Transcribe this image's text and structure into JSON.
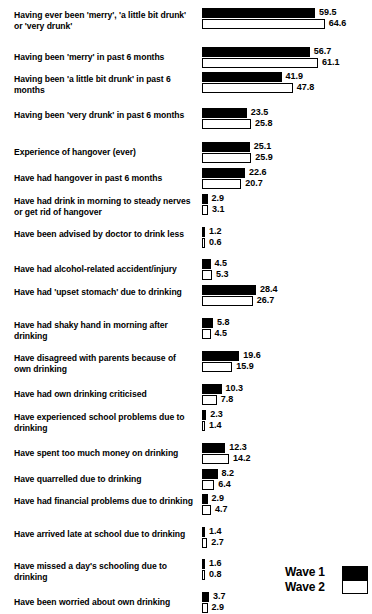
{
  "chart_data": {
    "type": "bar",
    "title": "",
    "subtitle": "",
    "xlabel": "",
    "ylabel": "",
    "orientation": "horizontal",
    "grid": false,
    "legend_position": "bottom-right",
    "xlim": [
      0,
      70
    ],
    "px_per_unit": 1.9,
    "legend": [
      {
        "name": "Wave 1",
        "fill": "#000000"
      },
      {
        "name": "Wave 2",
        "fill": "#ffffff"
      }
    ],
    "categories": [
      "Having ever been 'merry', 'a little bit drunk' or 'very drunk'",
      "Having been 'merry' in past 6 months",
      "Having been 'a little bit drunk' in past 6 months",
      "Having been 'very drunk' in past 6 months",
      "Experience of hangover (ever)",
      "Have had hangover in past 6 months",
      "Have had drink in morning to steady nerves or get rid of hangover",
      "Have been advised by doctor to drink less",
      "Have had alcohol-related accident/injury",
      "Have had 'upset stomach' due to drinking",
      "Have had shaky hand in morning after drinking",
      "Have disagreed with parents because of own drinking",
      "Have had own drinking criticised",
      "Have experienced school problems due to drinking",
      "Have spent too much money on drinking",
      "Have quarrelled due to drinking",
      "Have had financial problems due to drinking",
      "Have arrived late at school due to drinking",
      "Have missed a day's schooling due to drinking",
      "Have been worried about own drinking",
      "Have experienced alcohol-related problems"
    ],
    "series": [
      {
        "name": "Wave 1",
        "values": [
          59.5,
          56.7,
          41.9,
          23.5,
          25.1,
          22.6,
          2.9,
          1.2,
          4.5,
          28.4,
          5.8,
          19.6,
          10.3,
          2.3,
          12.3,
          8.2,
          2.9,
          1.4,
          1.6,
          3.7,
          3.9
        ]
      },
      {
        "name": "Wave 2",
        "values": [
          64.6,
          61.1,
          47.8,
          25.8,
          25.9,
          20.7,
          3.1,
          0.6,
          5.3,
          26.7,
          4.5,
          15.9,
          7.8,
          1.4,
          14.2,
          6.4,
          4.7,
          2.7,
          0.8,
          2.9,
          4.3
        ]
      }
    ],
    "rows": [
      {
        "label": "Having ever been 'merry', 'a little bit drunk' or 'very drunk'",
        "wave1": 59.5,
        "wave2": 64.6,
        "top": 8,
        "label_top": 9
      },
      {
        "label": "Having been 'merry' in past 6 months",
        "wave1": 56.7,
        "wave2": 61.1,
        "top": 48,
        "label_top": 53
      },
      {
        "label": "Having been 'a little bit drunk' in past 6 months",
        "wave1": 41.9,
        "wave2": 47.8,
        "top": 76,
        "label_top": 76
      },
      {
        "label": "Having been 'very drunk' in past 6 months",
        "wave1": 23.5,
        "wave2": 25.8,
        "top": 113,
        "label_top": 114
      },
      {
        "label": "Experience of hangover (ever)",
        "wave1": 25.1,
        "wave2": 25.9,
        "top": 150,
        "label_top": 155
      },
      {
        "label": "Have had hangover in past 6 months",
        "wave1": 22.6,
        "wave2": 20.7,
        "top": 178,
        "label_top": 183
      },
      {
        "label": "Have had drink in morning to steady nerves or get rid of hangover",
        "wave1": 2.9,
        "wave2": 3.1,
        "top": 205,
        "label_top": 206
      },
      {
        "label": "Have been advised by doctor to drink less",
        "wave1": 1.2,
        "wave2": 0.6,
        "top": 240,
        "label_top": 241
      },
      {
        "label": "Have had alcohol-related accident/injury",
        "wave1": 4.5,
        "wave2": 5.3,
        "top": 272,
        "label_top": 277
      },
      {
        "label": "Have had 'upset stomach' due to drinking",
        "wave1": 28.4,
        "wave2": 26.7,
        "top": 300,
        "label_top": 301
      },
      {
        "label": "Have had shaky hand in morning after drinking",
        "wave1": 5.8,
        "wave2": 4.5,
        "top": 335,
        "label_top": 336
      },
      {
        "label": "Have disagreed with parents because of own drinking",
        "wave1": 19.6,
        "wave2": 15.9,
        "top": 369,
        "label_top": 370
      },
      {
        "label": "Have had own drinking criticised",
        "wave1": 10.3,
        "wave2": 7.8,
        "top": 404,
        "label_top": 409
      },
      {
        "label": "Have experienced school problems due to drinking",
        "wave1": 2.3,
        "wave2": 1.4,
        "top": 431,
        "label_top": 432
      },
      {
        "label": "Have spent too much money on drinking",
        "wave1": 12.3,
        "wave2": 14.2,
        "top": 464,
        "label_top": 469
      },
      {
        "label": "Have quarrelled due to drinking",
        "wave1": 8.2,
        "wave2": 6.4,
        "top": 492,
        "label_top": 497
      },
      {
        "label": "Have had financial problems due to drinking",
        "wave1": 2.9,
        "wave2": 4.7,
        "top": 519,
        "label_top": 520
      },
      {
        "label": "Have arrived late at school due to drinking",
        "wave1": 1.4,
        "wave2": 2.7,
        "top": 551,
        "label_top": 552
      },
      {
        "label": "Have missed a day's schooling due to drinking",
        "wave1": 1.6,
        "wave2": 0.8,
        "top": 584,
        "label_top": 585
      },
      {
        "label": "Have been worried about own drinking",
        "wave1": 3.7,
        "wave2": 2.9,
        "top": 620,
        "label_top": 625
      },
      {
        "label": "Have experienced alcohol-related problems",
        "wave1": 3.9,
        "wave2": 4.3,
        "top": 652,
        "label_top": 653
      }
    ]
  }
}
